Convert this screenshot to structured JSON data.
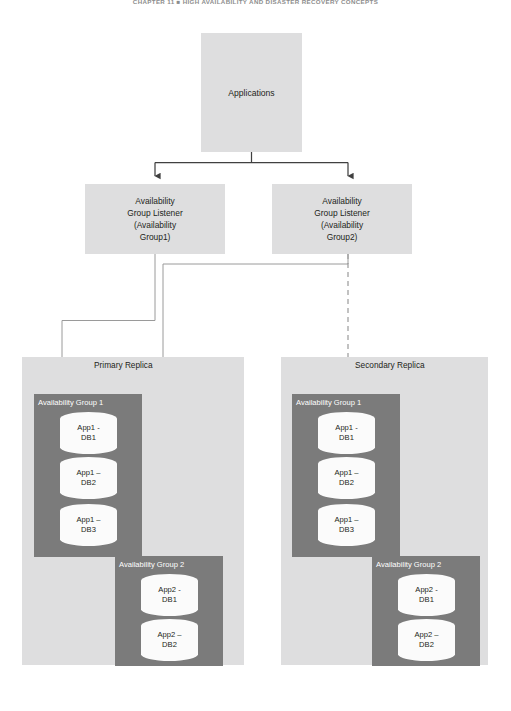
{
  "page": {
    "running_head": "CHAPTER 11 ■ HIGH AVAILABILITY AND DISASTER RECOVERY CONCEPTS",
    "width": 511,
    "height": 711
  },
  "colors": {
    "panel_light": "#dededf",
    "group_dark": "#7b7b7b",
    "db_fill": "#fbfbfb",
    "arrow_dark": "#404040",
    "connector_gray": "#9a9a9a",
    "text": "#231f20",
    "text_inverse": "#ffffff"
  },
  "diagram": {
    "type": "architecture-diagram",
    "applications": {
      "label": "Applications"
    },
    "listeners": [
      {
        "id": "listener-1",
        "line1": "Availability",
        "line2": "Group Listener",
        "line3": "(Availability",
        "line4": "Group1)"
      },
      {
        "id": "listener-2",
        "line1": "Availability",
        "line2": "Group Listener",
        "line3": "(Availability",
        "line4": "Group2)"
      }
    ],
    "replicas": [
      {
        "id": "primary",
        "label": "Primary Replica",
        "groups": [
          {
            "id": "ag1-primary",
            "title": "Availability Group 1",
            "databases": [
              {
                "line1": "App1 -",
                "line2": "DB1"
              },
              {
                "line1": "App1 –",
                "line2": "DB2"
              },
              {
                "line1": "App1 –",
                "line2": "DB3"
              }
            ]
          },
          {
            "id": "ag2-primary",
            "title": "Availability Group 2",
            "databases": [
              {
                "line1": "App2 -",
                "line2": "DB1"
              },
              {
                "line1": "App2 –",
                "line2": "DB2"
              }
            ]
          }
        ]
      },
      {
        "id": "secondary",
        "label": "Secondary Replica",
        "groups": [
          {
            "id": "ag1-secondary",
            "title": "Availability Group 1",
            "databases": [
              {
                "line1": "App1 -",
                "line2": "DB1"
              },
              {
                "line1": "App1 –",
                "line2": "DB2"
              },
              {
                "line1": "App1 –",
                "line2": "DB3"
              }
            ]
          },
          {
            "id": "ag2-secondary",
            "title": "Availability Group 2",
            "databases": [
              {
                "line1": "App2 -",
                "line2": "DB1"
              },
              {
                "line1": "App2 –",
                "line2": "DB2"
              }
            ]
          }
        ]
      }
    ],
    "connectors": [
      {
        "from": "applications",
        "to": "listener-1",
        "style": "solid-arrow"
      },
      {
        "from": "applications",
        "to": "listener-2",
        "style": "solid-arrow"
      },
      {
        "from": "listener-1",
        "to": "ag1-primary",
        "style": "thin-solid-arrow"
      },
      {
        "from": "listener-2",
        "to": "ag2-primary",
        "style": "thin-solid-arrow"
      },
      {
        "from": "listener-2",
        "to": "ag1-secondary",
        "style": "dashed-arrow"
      }
    ]
  }
}
